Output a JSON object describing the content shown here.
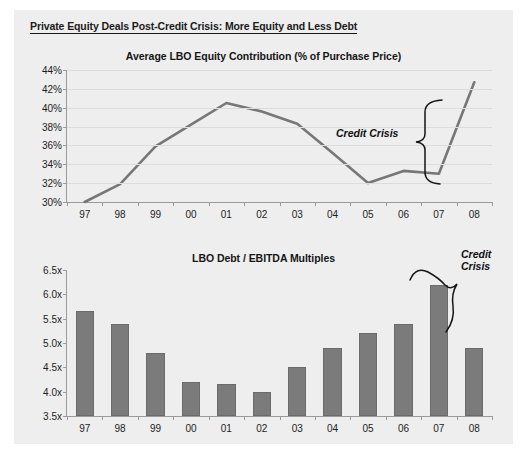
{
  "document": {
    "title": "Private Equity Deals Post-Credit Crisis: More Equity and Less Debt",
    "background_color": "#eeeeee",
    "accent_color": "#7b7b7b"
  },
  "annotations": {
    "line_chart_label": "Credit Crisis",
    "bar_chart_label": "Credit\nCrisis"
  },
  "chart_data": [
    {
      "type": "line",
      "title": "Average LBO Equity Contribution (% of Purchase Price)",
      "xlabel": "",
      "ylabel": "",
      "grid": true,
      "legend": "none",
      "categories": [
        "97",
        "98",
        "99",
        "00",
        "01",
        "02",
        "03",
        "04",
        "05",
        "06",
        "07",
        "08"
      ],
      "x": [
        "97",
        "98",
        "99",
        "00",
        "01",
        "02",
        "03",
        "04",
        "05",
        "06",
        "07",
        "08"
      ],
      "values": [
        30.0,
        31.9,
        35.9,
        38.2,
        40.5,
        39.6,
        38.3,
        35.2,
        32.0,
        33.3,
        33.0,
        42.7
      ],
      "ylim": [
        30,
        44
      ],
      "ytick_labels": [
        "30%",
        "32%",
        "34%",
        "36%",
        "38%",
        "40%",
        "42%",
        "44%"
      ],
      "ytick_values": [
        30,
        32,
        34,
        36,
        38,
        40,
        42,
        44
      ],
      "series_color": "#777777",
      "annotation": "Credit Crisis"
    },
    {
      "type": "bar",
      "title": "LBO Debt / EBITDA Multiples",
      "xlabel": "",
      "ylabel": "",
      "grid": false,
      "legend": "none",
      "categories": [
        "97",
        "98",
        "99",
        "00",
        "01",
        "02",
        "03",
        "04",
        "05",
        "06",
        "07",
        "08"
      ],
      "values": [
        5.65,
        5.4,
        4.8,
        4.2,
        4.15,
        4.0,
        4.5,
        4.9,
        5.2,
        5.4,
        6.2,
        4.9
      ],
      "ylim": [
        3.5,
        6.5
      ],
      "ytick_labels": [
        "3.5x",
        "4.0x",
        "4.5x",
        "5.0x",
        "5.5x",
        "6.0x",
        "6.5x"
      ],
      "ytick_values": [
        3.5,
        4.0,
        4.5,
        5.0,
        5.5,
        6.0,
        6.5
      ],
      "bar_color": "#7b7b7b",
      "annotation": "Credit Crisis"
    }
  ]
}
